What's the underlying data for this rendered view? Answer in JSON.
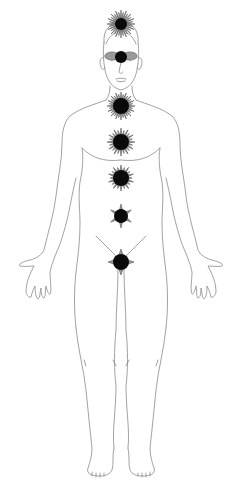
{
  "figure": {
    "colors": {
      "background": "#ffffff",
      "outline": "#8a8a8a",
      "petal": "#9a9a9a",
      "core": "#0a0a0a"
    }
  },
  "chakras": [
    {
      "name": "crown",
      "cx": 121,
      "cy": 24,
      "petals": 16,
      "radius": 14,
      "core_radius": 6
    },
    {
      "name": "third-eye",
      "cx": 121,
      "cy": 57,
      "petals": 2,
      "radius": 9,
      "core_radius": 6
    },
    {
      "name": "throat",
      "cx": 121,
      "cy": 106,
      "petals": 16,
      "radius": 14,
      "core_radius": 8
    },
    {
      "name": "heart",
      "cx": 121,
      "cy": 142,
      "petals": 12,
      "radius": 14,
      "core_radius": 8
    },
    {
      "name": "solar-plexus",
      "cx": 121,
      "cy": 178,
      "petals": 10,
      "radius": 13,
      "core_radius": 8
    },
    {
      "name": "sacral",
      "cx": 121,
      "cy": 216,
      "petals": 6,
      "radius": 12,
      "core_radius": 7
    },
    {
      "name": "root",
      "cx": 121,
      "cy": 262,
      "petals": 4,
      "radius": 13,
      "core_radius": 8
    }
  ]
}
